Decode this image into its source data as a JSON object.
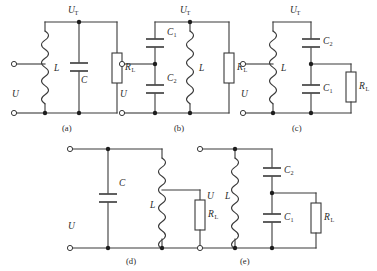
{
  "figure": {
    "title": "",
    "background_color": "#ffffff",
    "line_color": "#3a3a3a",
    "text_color": "#2a2a2a",
    "artifact_top_text": ""
  },
  "labels": {
    "source_voltage": "U",
    "tank_voltage_base": "U",
    "tank_voltage_sub": "T",
    "inductor": "L",
    "capacitor": "C",
    "capacitor_1_base": "C",
    "capacitor_1_sub": "1",
    "capacitor_2_base": "C",
    "capacitor_2_sub": "2",
    "resistor_base": "R",
    "resistor_sub": "L"
  },
  "circuits": [
    {
      "id": "a",
      "caption": "(a)",
      "description": "Parallel LC tank with load resistor across the tank",
      "components": [
        "L",
        "C",
        "R_L"
      ],
      "node_labels": [
        "U",
        "U_T"
      ]
    },
    {
      "id": "b",
      "caption": "(b)",
      "description": "Capacitive divider C1 over C2 feeding tap, inductor L in parallel, load resistor R_L",
      "components": [
        "C_1",
        "C_2",
        "L",
        "R_L"
      ],
      "node_labels": [
        "U",
        "U_T"
      ]
    },
    {
      "id": "c",
      "caption": "(c)",
      "description": "Inductor L in parallel, series capacitors C2 and C1, load resistor R_L tapped at their junction",
      "components": [
        "L",
        "C_2",
        "C_1",
        "R_L"
      ],
      "node_labels": [
        "U",
        "U_T"
      ]
    },
    {
      "id": "d",
      "caption": "(d)",
      "description": "Capacitor C in parallel with tapped inductor L, load resistor R_L from the tap",
      "components": [
        "C",
        "L",
        "R_L"
      ],
      "node_labels": [
        "U"
      ]
    },
    {
      "id": "e",
      "caption": "(e)",
      "description": "Inductor L in parallel with series capacitors C2 and C1, load resistor R_L tapped at their junction",
      "components": [
        "L",
        "C_2",
        "C_1",
        "R_L"
      ],
      "node_labels": [
        "U"
      ]
    }
  ]
}
